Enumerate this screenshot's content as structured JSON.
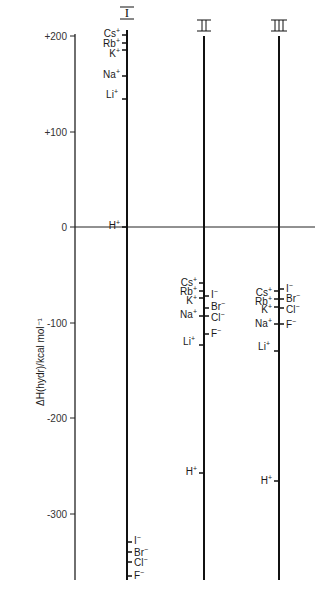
{
  "figure": {
    "y_axis": {
      "label": "ΔH(hydr)/kcal mol⁻¹",
      "ticks": [
        {
          "label": "+200",
          "value": 200
        },
        {
          "label": "+100",
          "value": 100
        },
        {
          "label": "0",
          "value": 0
        },
        {
          "label": "-100",
          "value": -100
        },
        {
          "label": "-200",
          "value": -200
        },
        {
          "label": "-300",
          "value": -300
        }
      ]
    },
    "columns": [
      {
        "id": "I",
        "label": "I",
        "entries": [
          {
            "ion": "Cs",
            "charge": "+",
            "value": 200
          },
          {
            "ion": "Rb",
            "charge": "+",
            "value": 192
          },
          {
            "ion": "K",
            "charge": "+",
            "value": 185
          },
          {
            "ion": "Na",
            "charge": "+",
            "value": 158
          },
          {
            "ion": "Li",
            "charge": "+",
            "value": 134
          },
          {
            "ion": "H",
            "charge": "+",
            "value": 0
          },
          {
            "ion": "I",
            "charge": "−",
            "value": -335
          },
          {
            "ion": "Br",
            "charge": "−",
            "value": -345
          },
          {
            "ion": "Cl",
            "charge": "−",
            "value": -355
          },
          {
            "ion": "F",
            "charge": "−",
            "value": -368
          }
        ]
      },
      {
        "id": "II",
        "label": "II",
        "entries": [
          {
            "ion": "Cs",
            "charge": "+",
            "value": -62
          },
          {
            "ion": "Rb",
            "charge": "+",
            "value": -70
          },
          {
            "ion": "K",
            "charge": "+",
            "value": -77
          },
          {
            "ion": "Na",
            "charge": "+",
            "value": -92
          },
          {
            "ion": "Li",
            "charge": "+",
            "value": -125
          },
          {
            "ion": "I",
            "charge": "−",
            "value": -73
          },
          {
            "ion": "Br",
            "charge": "−",
            "value": -84
          },
          {
            "ion": "Cl",
            "charge": "−",
            "value": -89
          },
          {
            "ion": "F",
            "charge": "−",
            "value": -112
          },
          {
            "ion": "H",
            "charge": "+",
            "value": -260
          }
        ]
      },
      {
        "id": "III",
        "label": "III",
        "entries": [
          {
            "ion": "Cs",
            "charge": "+",
            "value": -69
          },
          {
            "ion": "Rb",
            "charge": "+",
            "value": -77
          },
          {
            "ion": "K",
            "charge": "+",
            "value": -84
          },
          {
            "ion": "Na",
            "charge": "+",
            "value": -100
          },
          {
            "ion": "Li",
            "charge": "+",
            "value": -130
          },
          {
            "ion": "I",
            "charge": "−",
            "value": -66
          },
          {
            "ion": "Br",
            "charge": "−",
            "value": -76
          },
          {
            "ion": "Cl",
            "charge": "−",
            "value": -86
          },
          {
            "ion": "F",
            "charge": "−",
            "value": -103
          },
          {
            "ion": "H",
            "charge": "+",
            "value": -268
          }
        ]
      }
    ]
  }
}
